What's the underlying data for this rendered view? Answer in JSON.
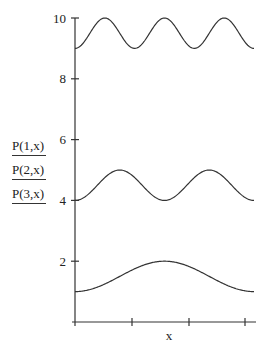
{
  "chart_data": {
    "type": "line",
    "title": "",
    "xlabel": "x",
    "ylabel": "",
    "ylim": [
      0,
      10
    ],
    "yticks": [
      2,
      4,
      6,
      8,
      10
    ],
    "xticks_count": 3,
    "grid": false,
    "legend_position": "left",
    "series": [
      {
        "name": "P(1,x)",
        "min": 1,
        "max": 2,
        "periods": 1,
        "start": "min"
      },
      {
        "name": "P(2,x)",
        "min": 4,
        "max": 5,
        "periods": 2,
        "start": "min"
      },
      {
        "name": "P(3,x)",
        "min": 9,
        "max": 10,
        "periods": 3,
        "start": "min"
      }
    ]
  },
  "legend": [
    "P(1,x)",
    "P(2,x)",
    "P(3,x)"
  ],
  "axis": {
    "x_label": "x",
    "y_tick_labels": [
      "2",
      "4",
      "6",
      "8",
      "10"
    ]
  }
}
